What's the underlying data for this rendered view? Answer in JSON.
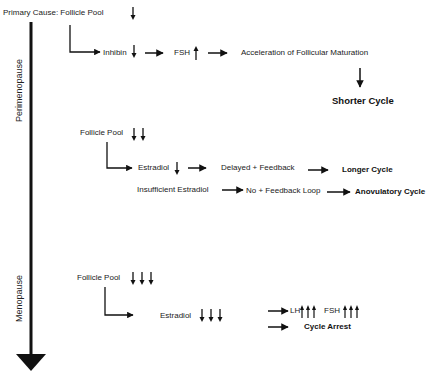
{
  "diagram": {
    "timeline": {
      "stages": [
        {
          "label": "Perimenopause"
        },
        {
          "label": "Menopause"
        }
      ],
      "direction": "down"
    },
    "perimenopause": {
      "primary_cause": "Primary Cause: Follicle Pool",
      "primary_cause_trend": "↓",
      "inhibin": "Inhibin",
      "inhibin_trend": "↓",
      "fsh": "FSH",
      "fsh_trend": "↑",
      "acceleration": "Acceleration of Follicular Maturation",
      "shorter_cycle": "Shorter Cycle",
      "follicle_pool_2": "Follicle Pool",
      "follicle_pool_2_trend": "↓↓",
      "estradiol": "Estradiol",
      "estradiol_trend": "↓",
      "delayed_feedback": "Delayed + Feedback",
      "longer_cycle": "Longer Cycle",
      "insufficient_estradiol": "Insufficient Estradiol",
      "no_feedback_loop": "No + Feedback Loop",
      "anovulatory_cycle": "Anovulatory Cycle"
    },
    "menopause": {
      "follicle_pool": "Follicle Pool",
      "follicle_pool_trend": "↓↓↓",
      "estradiol": "Estradiol",
      "estradiol_trend": "↓↓↓",
      "lh": "LH",
      "lh_trend": "↑↑↑",
      "fsh": "FSH",
      "fsh_trend": "↑↑↑",
      "cycle_arrest": "Cycle Arrest"
    },
    "colors": {
      "ink": "#111111",
      "background": "#ffffff"
    }
  }
}
